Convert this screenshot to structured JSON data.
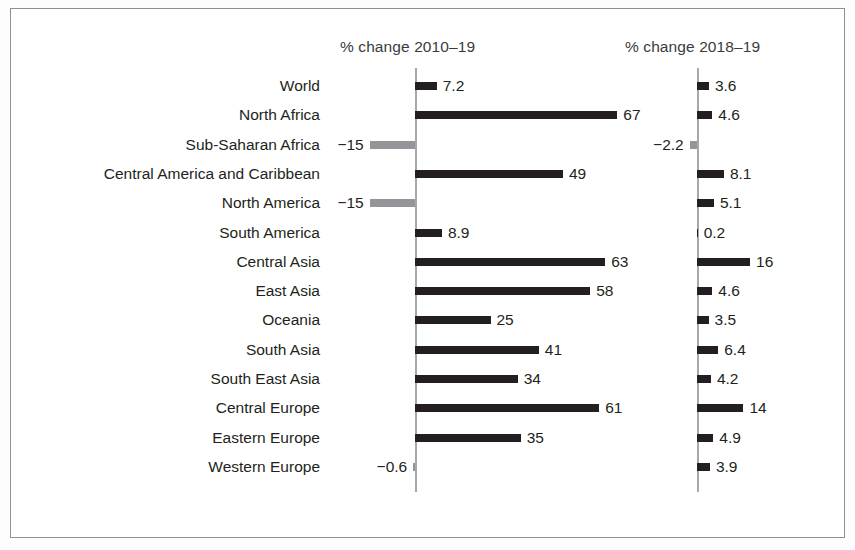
{
  "figure": {
    "panel1_header": "% change 2010–19",
    "panel2_header": "% change 2018–19",
    "colors": {
      "positive_bar": "#231f20",
      "negative_bar": "#939598",
      "axis": "#a6a8ab",
      "frame": "#8d8f91",
      "text": "#231f20",
      "header_text": "#3b3b3d",
      "background": "#ffffff"
    }
  },
  "chart_data": {
    "type": "bar",
    "title": "",
    "orientation": "horizontal",
    "grid": false,
    "legend": "none",
    "categories": [
      "World",
      "North Africa",
      "Sub-Saharan Africa",
      "Central America and Caribbean",
      "North America",
      "South America",
      "Central Asia",
      "East Asia",
      "Oceania",
      "South Asia",
      "South East Asia",
      "Central Europe",
      "Eastern Europe",
      "Western Europe"
    ],
    "series": [
      {
        "name": "% change 2010–19",
        "xlabel": "% change 2010–19",
        "values": [
          7.2,
          67,
          -15,
          49,
          -15,
          8.9,
          63,
          58,
          25,
          41,
          34,
          61,
          35,
          -0.6
        ],
        "labels": [
          "7.2",
          "67",
          "−15",
          "49",
          "−15",
          "8.9",
          "63",
          "58",
          "25",
          "41",
          "34",
          "61",
          "35",
          "−0.6"
        ],
        "xlim": [
          -20,
          75
        ]
      },
      {
        "name": "% change 2018–19",
        "xlabel": "% change 2018–19",
        "values": [
          3.6,
          4.6,
          -2.2,
          8.1,
          5.1,
          0.2,
          16,
          4.6,
          3.5,
          6.4,
          4.2,
          14,
          4.9,
          3.9
        ],
        "labels": [
          "3.6",
          "4.6",
          "−2.2",
          "8.1",
          "5.1",
          "0.2",
          "16",
          "4.6",
          "3.5",
          "6.4",
          "4.2",
          "14",
          "4.9",
          "3.9"
        ],
        "xlim": [
          -4,
          18
        ]
      }
    ]
  }
}
